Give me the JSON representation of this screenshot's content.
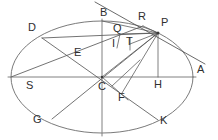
{
  "figure": {
    "kind": "geometry-diagram",
    "shape": "ellipse",
    "background_color": "#ffffff",
    "stroke_color": "#6b6b6b",
    "label_color": "#2e2e2e",
    "width": 218,
    "height": 140
  },
  "labels": {
    "A": "A",
    "B": "B",
    "C": "C",
    "D": "D",
    "E": "E",
    "F": "F",
    "G": "G",
    "H": "H",
    "I": "I",
    "K": "K",
    "P": "P",
    "Q": "Q",
    "R": "R",
    "S": "S",
    "T": "T"
  },
  "points": [
    {
      "id": "A",
      "label": "A",
      "x": 192,
      "y": 77,
      "label_x": 197,
      "label_y": 70,
      "on_curve": true
    },
    {
      "id": "B",
      "label": "B",
      "x": 102,
      "y": 21,
      "label_x": 100,
      "label_y": 10,
      "on_curve": true
    },
    {
      "id": "C",
      "label": "C",
      "x": 102,
      "y": 77,
      "label_x": 99,
      "label_y": 84,
      "on_curve": false
    },
    {
      "id": "D",
      "label": "D",
      "x": 42,
      "y": 38,
      "label_x": 30,
      "label_y": 26,
      "on_curve": true
    },
    {
      "id": "E",
      "label": "E",
      "x": 80,
      "y": 57,
      "label_x": 76,
      "label_y": 50,
      "on_curve": false
    },
    {
      "id": "F",
      "label": "F",
      "x": 122,
      "y": 93,
      "label_x": 119,
      "label_y": 94,
      "on_curve": false
    },
    {
      "id": "G",
      "label": "G",
      "x": 52,
      "y": 119,
      "label_x": 36,
      "label_y": 117,
      "on_curve": true
    },
    {
      "id": "H",
      "label": "H",
      "x": 158,
      "y": 77,
      "label_x": 155,
      "label_y": 81,
      "on_curve": false
    },
    {
      "id": "I",
      "label": "I",
      "x": 117,
      "y": 44,
      "label_x": 113,
      "label_y": 39,
      "on_curve": false
    },
    {
      "id": "K",
      "label": "K",
      "x": 158,
      "y": 120,
      "label_x": 160,
      "label_y": 118,
      "on_curve": true
    },
    {
      "id": "P",
      "label": "P",
      "x": 158,
      "y": 33,
      "label_x": 160,
      "label_y": 21,
      "on_curve": true
    },
    {
      "id": "Q",
      "label": "Q",
      "x": 120,
      "y": 34,
      "label_x": 114,
      "label_y": 26,
      "on_curve": false
    },
    {
      "id": "R",
      "label": "R",
      "x": 143,
      "y": 26,
      "label_x": 138,
      "label_y": 14,
      "on_curve": true
    },
    {
      "id": "S",
      "label": "S",
      "x": 11,
      "y": 77,
      "label_x": 27,
      "label_y": 82,
      "on_curve": true
    },
    {
      "id": "T",
      "label": "T",
      "x": 130,
      "y": 44,
      "label_x": 127,
      "label_y": 38,
      "on_curve": false
    }
  ],
  "ellipse": {
    "center_x": 102,
    "center_y": 77,
    "radius_x": 91,
    "radius_y": 56
  },
  "segments": [
    {
      "name": "major-axis-SA",
      "from": "S",
      "to": "A",
      "style": "axis"
    },
    {
      "name": "minor-axis-B-bottom",
      "from": "B",
      "to": "Bc",
      "style": "axis"
    },
    {
      "name": "diameter-DK",
      "from": "D",
      "to": "K",
      "style": "chord"
    },
    {
      "name": "diameter-GP",
      "from": "G",
      "to": "P",
      "style": "chord"
    },
    {
      "name": "chord-D-P",
      "from": "D",
      "to": "P",
      "style": "chord"
    },
    {
      "name": "chord-S-R",
      "from": "S",
      "to": "R",
      "style": "chord"
    },
    {
      "name": "ordinate-PH",
      "from": "P",
      "to": "H",
      "style": "thin"
    },
    {
      "name": "radius-CP",
      "from": "C",
      "to": "P",
      "style": "thin"
    },
    {
      "name": "segment-B-P",
      "from": "B",
      "to": "P",
      "style": "thin"
    },
    {
      "name": "segment-Q-P",
      "from": "Q",
      "to": "P",
      "style": "thin"
    },
    {
      "name": "segment-R-P",
      "from": "R",
      "to": "P",
      "style": "thin"
    },
    {
      "name": "segment-T-P",
      "from": "T",
      "to": "P",
      "style": "thin"
    },
    {
      "name": "segment-Q-I",
      "from": "Q",
      "to": "I",
      "style": "thin"
    },
    {
      "name": "segment-F-P",
      "from": "F",
      "to": "P",
      "style": "thin"
    },
    {
      "name": "tangent-at-P",
      "from": "tan1",
      "to": "tan2",
      "style": "tangent"
    }
  ]
}
